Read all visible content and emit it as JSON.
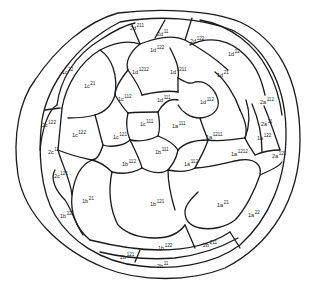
{
  "diagram": {
    "type": "embryo cell lineage diagram",
    "labels": [
      {
        "id": "2d211",
        "base": "2d",
        "sup": "211",
        "x": 130,
        "y": 24
      },
      {
        "id": "2d11",
        "base": "2d",
        "sup": "11",
        "x": 157,
        "y": 30
      },
      {
        "id": "2d12",
        "base": "2d",
        "sup": "122",
        "x": 190,
        "y": 37
      },
      {
        "id": "1d122",
        "base": "1d",
        "sup": "122",
        "x": 150,
        "y": 46
      },
      {
        "id": "1d22",
        "base": "1d",
        "sup": "22",
        "x": 228,
        "y": 50
      },
      {
        "id": "1c22",
        "base": "1c",
        "sup": "22",
        "x": 62,
        "y": 68
      },
      {
        "id": "1c21",
        "base": "1c",
        "sup": "21",
        "x": 84,
        "y": 82
      },
      {
        "id": "1d1212",
        "base": "1d",
        "sup": "1212",
        "x": 132,
        "y": 68
      },
      {
        "id": "1d1211",
        "base": "1d",
        "sup": "1211",
        "x": 170,
        "y": 68
      },
      {
        "id": "1d21",
        "base": "1d",
        "sup": "21",
        "x": 217,
        "y": 71
      },
      {
        "id": "1c112",
        "base": "1c",
        "sup": "112",
        "x": 118,
        "y": 95
      },
      {
        "id": "1d111",
        "base": "1d",
        "sup": "111",
        "x": 157,
        "y": 96
      },
      {
        "id": "1d112",
        "base": "1d",
        "sup": "112",
        "x": 200,
        "y": 98
      },
      {
        "id": "2a112",
        "base": "2a",
        "sup": "112",
        "x": 260,
        "y": 98
      },
      {
        "id": "2c122",
        "base": "2c",
        "sup": "122",
        "x": 42,
        "y": 121
      },
      {
        "id": "1c111",
        "base": "1c",
        "sup": "111",
        "x": 140,
        "y": 120
      },
      {
        "id": "1a111",
        "base": "1a",
        "sup": "111",
        "x": 172,
        "y": 122
      },
      {
        "id": "2a11",
        "base": "2a",
        "sup": "11",
        "x": 261,
        "y": 120
      },
      {
        "id": "1c122",
        "base": "1c",
        "sup": "122",
        "x": 72,
        "y": 131
      },
      {
        "id": "1c121",
        "base": "1c",
        "sup": "121",
        "x": 113,
        "y": 133
      },
      {
        "id": "1a1211",
        "base": "1a",
        "sup": "1211",
        "x": 206,
        "y": 133
      },
      {
        "id": "1a122",
        "base": "1a",
        "sup": "122",
        "x": 257,
        "y": 134
      },
      {
        "id": "2c11",
        "base": "2c",
        "sup": "11",
        "x": 48,
        "y": 148
      },
      {
        "id": "1b111",
        "base": "1b",
        "sup": "111",
        "x": 155,
        "y": 148
      },
      {
        "id": "1a1212",
        "base": "1a",
        "sup": "1212",
        "x": 231,
        "y": 150
      },
      {
        "id": "2a121",
        "base": "2a",
        "sup": "121",
        "x": 272,
        "y": 152
      },
      {
        "id": "1b112",
        "base": "1b",
        "sup": "112",
        "x": 122,
        "y": 160
      },
      {
        "id": "1a112",
        "base": "1a",
        "sup": "112",
        "x": 184,
        "y": 160
      },
      {
        "id": "2c121",
        "base": "2c",
        "sup": "121",
        "x": 54,
        "y": 172
      },
      {
        "id": "1b21",
        "base": "1b",
        "sup": "21",
        "x": 82,
        "y": 197
      },
      {
        "id": "1b121",
        "base": "1b",
        "sup": "121",
        "x": 150,
        "y": 200
      },
      {
        "id": "1a21",
        "base": "1a",
        "sup": "21",
        "x": 217,
        "y": 201
      },
      {
        "id": "1b22",
        "base": "1b",
        "sup": "22",
        "x": 60,
        "y": 212
      },
      {
        "id": "1a22",
        "base": "1a",
        "sup": "22",
        "x": 248,
        "y": 211
      },
      {
        "id": "1b122",
        "base": "1b",
        "sup": "122",
        "x": 158,
        "y": 244
      },
      {
        "id": "2b211",
        "base": "2b",
        "sup": "211",
        "x": 203,
        "y": 241
      },
      {
        "id": "2b121",
        "base": "2b",
        "sup": "121",
        "x": 120,
        "y": 253
      },
      {
        "id": "2b11",
        "base": "2b",
        "sup": "11",
        "x": 157,
        "y": 262
      }
    ]
  }
}
